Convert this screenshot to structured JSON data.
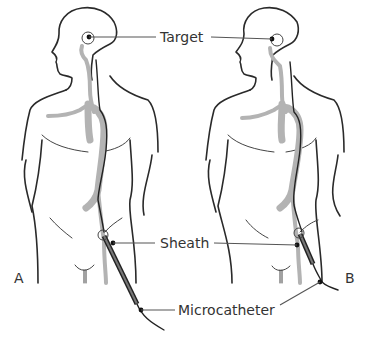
{
  "figure": {
    "panels": [
      {
        "id": "A",
        "label": "A"
      },
      {
        "id": "B",
        "label": "B"
      }
    ],
    "labels": {
      "target": "Target",
      "sheath": "Sheath",
      "microcatheter": "Microcatheter"
    },
    "colors": {
      "outline": "#2a2a2a",
      "vessel": "#b3b3b3",
      "text": "#333333",
      "background": "#ffffff"
    }
  }
}
